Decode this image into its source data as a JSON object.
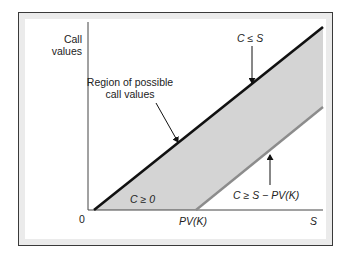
{
  "diagram": {
    "type": "option-price-bounds",
    "axes": {
      "y_label_line1": "Call",
      "y_label_line2": "values",
      "x_label": "S",
      "origin_label": "0",
      "x_tick_label": "PV(K)"
    },
    "regions": {
      "shaded_label_line1": "Region of possible",
      "shaded_label_line2": "call values",
      "shaded_color": "#d4d4d4"
    },
    "bounds": {
      "upper": {
        "label": "C ≤ S",
        "line_color": "#111111"
      },
      "lower_zero": {
        "label": "C ≥ 0"
      },
      "lower_intrinsic": {
        "label": "C ≥ S − PV(K)",
        "line_color": "#8c8c8c"
      }
    },
    "frame": {
      "border_color": "#3a3a3a",
      "band_color": "#ebebeb"
    }
  }
}
